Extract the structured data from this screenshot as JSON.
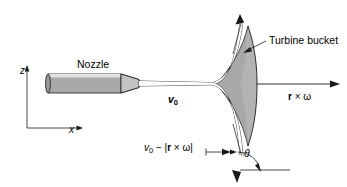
{
  "figure": {
    "background_color": "#ffffff",
    "line_color": "#1a1a1a",
    "nozzle_fill": "#a9a9a9",
    "nozzle_highlight": "#d9d9d9",
    "bucket_fill": "#b3b3b3"
  },
  "axes": {
    "z_label": "z",
    "x_label": "x"
  },
  "labels": {
    "nozzle": "Nozzle",
    "turbine_bucket": "Turbine bucket",
    "jet_velocity": "v",
    "jet_velocity_sub": "0",
    "blade_speed_r": "r",
    "blade_speed_times": " × ",
    "blade_speed_omega": "ω",
    "relative_velocity_v": "v",
    "relative_velocity_sub": "0",
    "relative_velocity_minus": " − |",
    "relative_velocity_r": "r",
    "relative_velocity_times": " × ",
    "relative_velocity_omega": "ω",
    "relative_velocity_close": "|",
    "theta": "θ"
  }
}
